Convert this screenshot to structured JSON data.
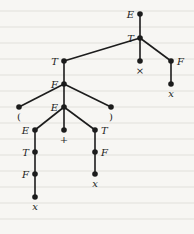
{
  "diagram": {
    "type": "parse-tree",
    "colors": {
      "ink": "#1c1c1c",
      "paper": "#f7f6f3"
    },
    "nodes": [
      {
        "id": "n1",
        "label": "E",
        "x": 140,
        "y": 14,
        "label_side": "left",
        "italic": true
      },
      {
        "id": "n2",
        "label": "T",
        "x": 140,
        "y": 38,
        "label_side": "left",
        "italic": true
      },
      {
        "id": "n3",
        "label": "×",
        "x": 140,
        "y": 61,
        "label_side": "below",
        "italic": false
      },
      {
        "id": "n4",
        "label": "F",
        "x": 171,
        "y": 61,
        "label_side": "right",
        "italic": true
      },
      {
        "id": "n5",
        "label": "x",
        "x": 171,
        "y": 84,
        "label_side": "below",
        "italic": true
      },
      {
        "id": "n6",
        "label": "T",
        "x": 64,
        "y": 61,
        "label_side": "left",
        "italic": true
      },
      {
        "id": "n7",
        "label": "F",
        "x": 64,
        "y": 84,
        "label_side": "left",
        "italic": true
      },
      {
        "id": "n8",
        "label": "(",
        "x": 19,
        "y": 107,
        "label_side": "below",
        "italic": false
      },
      {
        "id": "n9",
        "label": "E",
        "x": 64,
        "y": 107,
        "label_side": "left",
        "italic": true
      },
      {
        "id": "n10",
        "label": ")",
        "x": 111,
        "y": 107,
        "label_side": "below",
        "italic": false
      },
      {
        "id": "n11",
        "label": "E",
        "x": 35,
        "y": 130,
        "label_side": "left",
        "italic": true
      },
      {
        "id": "n12",
        "label": "+",
        "x": 64,
        "y": 130,
        "label_side": "below",
        "italic": false
      },
      {
        "id": "n13",
        "label": "T",
        "x": 95,
        "y": 130,
        "label_side": "right",
        "italic": true
      },
      {
        "id": "n14",
        "label": "T",
        "x": 35,
        "y": 152,
        "label_side": "left",
        "italic": true
      },
      {
        "id": "n15",
        "label": "F",
        "x": 35,
        "y": 174,
        "label_side": "left",
        "italic": true
      },
      {
        "id": "n16",
        "label": "x",
        "x": 35,
        "y": 197,
        "label_side": "below",
        "italic": true
      },
      {
        "id": "n17",
        "label": "F",
        "x": 95,
        "y": 152,
        "label_side": "right",
        "italic": true
      },
      {
        "id": "n18",
        "label": "x",
        "x": 95,
        "y": 174,
        "label_side": "below",
        "italic": true
      }
    ],
    "edges": [
      [
        "n1",
        "n2"
      ],
      [
        "n2",
        "n6"
      ],
      [
        "n2",
        "n3"
      ],
      [
        "n2",
        "n4"
      ],
      [
        "n4",
        "n5"
      ],
      [
        "n6",
        "n7"
      ],
      [
        "n7",
        "n8"
      ],
      [
        "n7",
        "n9"
      ],
      [
        "n7",
        "n10"
      ],
      [
        "n9",
        "n11"
      ],
      [
        "n9",
        "n12"
      ],
      [
        "n9",
        "n13"
      ],
      [
        "n11",
        "n14"
      ],
      [
        "n14",
        "n15"
      ],
      [
        "n15",
        "n16"
      ],
      [
        "n13",
        "n17"
      ],
      [
        "n17",
        "n18"
      ]
    ]
  }
}
